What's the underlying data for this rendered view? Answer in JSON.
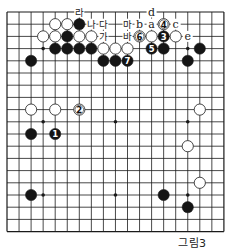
{
  "diagram": {
    "caption": "그림3",
    "board_size": 19,
    "colors": {
      "line": "#1a1a1a",
      "black": "#151515",
      "white": "#ffffff",
      "background": "#ffffff"
    },
    "star_points": [
      [
        3,
        3
      ],
      [
        3,
        9
      ],
      [
        3,
        15
      ],
      [
        9,
        3
      ],
      [
        9,
        9
      ],
      [
        9,
        15
      ],
      [
        15,
        3
      ],
      [
        15,
        9
      ],
      [
        15,
        15
      ]
    ],
    "stones": [
      {
        "color": "white",
        "row": 1,
        "col": 4
      },
      {
        "color": "white",
        "row": 1,
        "col": 5
      },
      {
        "color": "black",
        "row": 1,
        "col": 6
      },
      {
        "color": "white",
        "row": 1,
        "col": 13,
        "label": "4"
      },
      {
        "color": "white",
        "row": 2,
        "col": 3
      },
      {
        "color": "white",
        "row": 2,
        "col": 4
      },
      {
        "color": "black",
        "row": 2,
        "col": 5
      },
      {
        "color": "white",
        "row": 2,
        "col": 6
      },
      {
        "color": "white",
        "row": 2,
        "col": 7
      },
      {
        "color": "white",
        "row": 2,
        "col": 11,
        "label": "6"
      },
      {
        "color": "white",
        "row": 2,
        "col": 12
      },
      {
        "color": "black",
        "row": 2,
        "col": 13,
        "label": "3"
      },
      {
        "color": "white",
        "row": 2,
        "col": 14
      },
      {
        "color": "black",
        "row": 3,
        "col": 4
      },
      {
        "color": "black",
        "row": 3,
        "col": 5
      },
      {
        "color": "black",
        "row": 3,
        "col": 6
      },
      {
        "color": "black",
        "row": 3,
        "col": 7
      },
      {
        "color": "white",
        "row": 3,
        "col": 8
      },
      {
        "color": "white",
        "row": 3,
        "col": 9
      },
      {
        "color": "white",
        "row": 3,
        "col": 10
      },
      {
        "color": "black",
        "row": 3,
        "col": 12,
        "label": "5"
      },
      {
        "color": "black",
        "row": 3,
        "col": 13
      },
      {
        "color": "black",
        "row": 3,
        "col": 16
      },
      {
        "color": "black",
        "row": 4,
        "col": 2
      },
      {
        "color": "black",
        "row": 4,
        "col": 8
      },
      {
        "color": "black",
        "row": 4,
        "col": 9
      },
      {
        "color": "black",
        "row": 4,
        "col": 10,
        "label": "7"
      },
      {
        "color": "black",
        "row": 4,
        "col": 15
      },
      {
        "color": "white",
        "row": 8,
        "col": 2
      },
      {
        "color": "white",
        "row": 8,
        "col": 4
      },
      {
        "color": "white",
        "row": 8,
        "col": 6,
        "label": "2"
      },
      {
        "color": "white",
        "row": 8,
        "col": 16
      },
      {
        "color": "black",
        "row": 10,
        "col": 2
      },
      {
        "color": "black",
        "row": 10,
        "col": 4,
        "label": "1"
      },
      {
        "color": "white",
        "row": 11,
        "col": 15
      },
      {
        "color": "white",
        "row": 14,
        "col": 16
      },
      {
        "color": "black",
        "row": 15,
        "col": 2
      },
      {
        "color": "black",
        "row": 15,
        "col": 13
      },
      {
        "color": "black",
        "row": 16,
        "col": 15
      }
    ],
    "point_labels": [
      {
        "text": "라",
        "row": 0,
        "col": 6
      },
      {
        "text": "d",
        "row": 0,
        "col": 12
      },
      {
        "text": "나",
        "row": 1,
        "col": 7
      },
      {
        "text": "다",
        "row": 1,
        "col": 8
      },
      {
        "text": "마",
        "row": 1,
        "col": 10
      },
      {
        "text": "b",
        "row": 1,
        "col": 11
      },
      {
        "text": "a",
        "row": 1,
        "col": 12
      },
      {
        "text": "c",
        "row": 1,
        "col": 14
      },
      {
        "text": "가",
        "row": 2,
        "col": 8
      },
      {
        "text": "바",
        "row": 2,
        "col": 10
      },
      {
        "text": "e",
        "row": 2,
        "col": 15
      }
    ]
  }
}
